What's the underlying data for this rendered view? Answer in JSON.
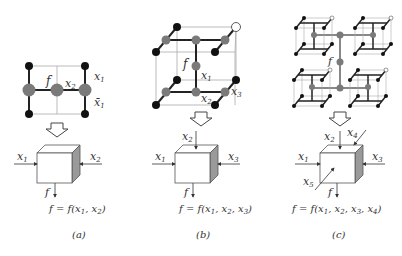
{
  "panels": [
    {
      "id": "a",
      "caption": "(a)",
      "lattice_labels": {
        "f": "f",
        "x2": "x2",
        "x1": "x1",
        "x1bar": "x̄1"
      },
      "box_inputs": [
        "x1",
        "x2"
      ],
      "box_output": "f",
      "equation": "f = f(x1, x2)"
    },
    {
      "id": "b",
      "caption": "(b)",
      "lattice_labels": {
        "f": "f",
        "x1": "x1",
        "x2": "x2",
        "x3": "x3"
      },
      "box_inputs": [
        "x1",
        "x2",
        "x3"
      ],
      "box_output": "f",
      "equation": "f = f(x1, x2, x3)"
    },
    {
      "id": "c",
      "caption": "(c)",
      "lattice_labels": {
        "f": "f"
      },
      "box_inputs": [
        "x1",
        "x2",
        "x3",
        "x4",
        "x5"
      ],
      "box_output": "f",
      "equation": "f = f(x1, x2, x3, x4)"
    }
  ],
  "colors": {
    "black_node": "#111111",
    "gray_node": "#7a7a7a",
    "white_node": "#ffffff",
    "line": "#222222",
    "thin_line": "#999999",
    "cube_side": "#9a9a9a"
  }
}
